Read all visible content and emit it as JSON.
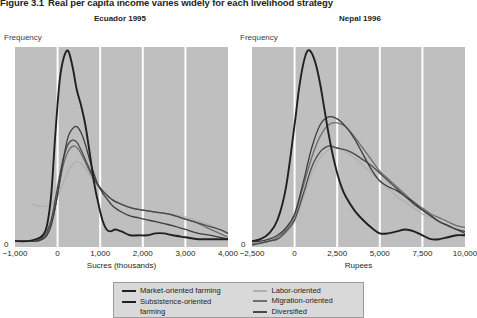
{
  "figure": {
    "number": "Figure 3.1",
    "title": "Real per capita income varies widely for each livelihood strategy"
  },
  "panels": [
    {
      "id": "ecuador",
      "title": "Ecuador 1995",
      "ylabel": "Frequency",
      "xlabel": "Sucres (thousands)",
      "y_zero_label": "0",
      "xticks": [
        "−1,000",
        "0",
        "1,000",
        "2,000",
        "3,000",
        "4,000"
      ]
    },
    {
      "id": "nepal",
      "title": "Nepal 1996",
      "ylabel": "Frequency",
      "xlabel": "Rupees",
      "y_zero_label": "0",
      "xticks": [
        "−2,500",
        "0",
        "2,500",
        "5,000",
        "7,500",
        "10,000"
      ]
    }
  ],
  "legend": {
    "items": [
      {
        "label": "Market-oriented farming",
        "color": "#231f20"
      },
      {
        "label": "Subsistence-oriented",
        "label_cont": "farming",
        "color": "#231f20"
      },
      {
        "label": "Labor-oriented",
        "color": "#b0b0b0"
      },
      {
        "label": "Migration-oriented",
        "color": "#6e6e6e"
      },
      {
        "label": "Diversified",
        "color": "#4a4a4a"
      }
    ]
  },
  "colors": {
    "plot_background": "#bfbfbf",
    "gridline": "#ffffff",
    "legend_background": "#d9d9d9",
    "legend_border": "#9b9b9b",
    "text": "#231f20"
  },
  "chart_data": {
    "type": "line",
    "title": "Real per capita income varies widely for each livelihood strategy",
    "panels": [
      {
        "title": "Ecuador 1995",
        "xlabel": "Sucres (thousands)",
        "ylabel": "Frequency",
        "xlim": [
          -1000,
          4000
        ],
        "ylim": [
          0,
          1
        ],
        "grid": "vertical",
        "xticks": [
          -1000,
          0,
          1000,
          2000,
          3000,
          4000
        ],
        "series": [
          {
            "name": "Market-oriented farming",
            "color": "#231f20",
            "x": [
              -1000,
              -700,
              -500,
              -350,
              -250,
              -150,
              -50,
              50,
              150,
              250,
              350,
              450,
              550,
              650,
              750,
              850,
              950,
              1050,
              1150,
              1250,
              1350,
              1500,
              1700,
              1900,
              2100,
              2300,
              2500,
              2700,
              3000,
              3300,
              3600,
              4000
            ],
            "values": [
              0.02,
              0.02,
              0.03,
              0.05,
              0.1,
              0.26,
              0.58,
              0.85,
              0.97,
              1.0,
              0.92,
              0.8,
              0.72,
              0.62,
              0.48,
              0.33,
              0.22,
              0.13,
              0.08,
              0.07,
              0.08,
              0.07,
              0.05,
              0.05,
              0.05,
              0.06,
              0.06,
              0.05,
              0.04,
              0.03,
              0.03,
              0.03
            ]
          },
          {
            "name": "Subsistence-oriented farming",
            "color": "#3d3d3d",
            "x": [
              -1000,
              -700,
              -500,
              -350,
              -250,
              -150,
              -50,
              50,
              150,
              250,
              350,
              450,
              550,
              650,
              750,
              850,
              950,
              1050,
              1150,
              1300,
              1500,
              1700,
              1900,
              2100,
              2300,
              2500,
              2700,
              3000,
              3300,
              3600,
              4000
            ],
            "values": [
              0.02,
              0.02,
              0.02,
              0.03,
              0.05,
              0.1,
              0.2,
              0.33,
              0.46,
              0.56,
              0.6,
              0.61,
              0.58,
              0.52,
              0.44,
              0.37,
              0.31,
              0.27,
              0.24,
              0.2,
              0.17,
              0.15,
              0.14,
              0.13,
              0.12,
              0.11,
              0.1,
              0.08,
              0.06,
              0.05,
              0.03
            ]
          },
          {
            "name": "Labor-oriented",
            "color": "#b0b0b0",
            "x": [
              -600,
              -450,
              -300,
              -150,
              0,
              150,
              300,
              450,
              600,
              750,
              900,
              1050,
              1250,
              1500,
              1750,
              2000,
              2300,
              2600,
              2900,
              3200,
              3500,
              3800,
              4000
            ],
            "values": [
              0.21,
              0.2,
              0.2,
              0.21,
              0.25,
              0.33,
              0.4,
              0.43,
              0.41,
              0.36,
              0.32,
              0.28,
              0.24,
              0.21,
              0.19,
              0.18,
              0.17,
              0.16,
              0.15,
              0.13,
              0.11,
              0.08,
              0.06
            ]
          },
          {
            "name": "Migration-oriented",
            "color": "#6e6e6e",
            "x": [
              -450,
              -300,
              -200,
              -100,
              0,
              100,
              200,
              300,
              400,
              500,
              600,
              750,
              900,
              1050,
              1250,
              1500,
              1750,
              2000,
              2300,
              2600,
              2900,
              3200,
              3500,
              3800,
              4000
            ],
            "values": [
              0.02,
              0.04,
              0.08,
              0.15,
              0.26,
              0.38,
              0.46,
              0.5,
              0.51,
              0.49,
              0.45,
              0.38,
              0.32,
              0.28,
              0.24,
              0.21,
              0.19,
              0.18,
              0.17,
              0.16,
              0.14,
              0.12,
              0.09,
              0.06,
              0.04
            ]
          },
          {
            "name": "Diversified",
            "color": "#4a4a4a",
            "x": [
              -500,
              -350,
              -250,
              -150,
              -50,
              50,
              150,
              250,
              350,
              450,
              550,
              650,
              800,
              950,
              1100,
              1300,
              1500,
              1750,
              2000,
              2300,
              2600,
              2900,
              3200,
              3500,
              3800,
              4000
            ],
            "values": [
              0.02,
              0.04,
              0.07,
              0.13,
              0.24,
              0.36,
              0.46,
              0.52,
              0.54,
              0.53,
              0.49,
              0.44,
              0.37,
              0.31,
              0.27,
              0.23,
              0.21,
              0.19,
              0.18,
              0.17,
              0.16,
              0.14,
              0.12,
              0.1,
              0.08,
              0.06
            ]
          }
        ]
      },
      {
        "title": "Nepal 1996",
        "xlabel": "Rupees",
        "ylabel": "Frequency",
        "xlim": [
          -2500,
          10000
        ],
        "ylim": [
          0,
          1
        ],
        "grid": "vertical",
        "xticks": [
          -2500,
          0,
          2500,
          5000,
          7500,
          10000
        ],
        "series": [
          {
            "name": "Market-oriented farming",
            "color": "#231f20",
            "x": [
              -2500,
              -2000,
              -1500,
              -1000,
              -500,
              0,
              250,
              500,
              750,
              1000,
              1250,
              1500,
              1750,
              2000,
              2250,
              2500,
              2750,
              3000,
              3500,
              4000,
              4500,
              5000,
              5500,
              6000,
              6500,
              7000,
              7500,
              8000,
              8500,
              9000,
              9500,
              10000
            ],
            "values": [
              0.02,
              0.03,
              0.06,
              0.13,
              0.3,
              0.62,
              0.8,
              0.93,
              1.0,
              0.99,
              0.93,
              0.83,
              0.7,
              0.57,
              0.46,
              0.37,
              0.3,
              0.25,
              0.18,
              0.13,
              0.09,
              0.06,
              0.06,
              0.07,
              0.08,
              0.07,
              0.05,
              0.03,
              0.03,
              0.04,
              0.05,
              0.05
            ]
          },
          {
            "name": "Subsistence-oriented farming",
            "color": "#3d3d3d",
            "x": [
              -2500,
              -2000,
              -1500,
              -1000,
              -500,
              0,
              500,
              1000,
              1500,
              2000,
              2500,
              3000,
              3500,
              4000,
              4500,
              5000,
              5500,
              6000,
              6500,
              7000,
              7500,
              8000,
              8500,
              9000,
              9500,
              10000
            ],
            "values": [
              0.02,
              0.02,
              0.03,
              0.05,
              0.09,
              0.16,
              0.32,
              0.5,
              0.62,
              0.66,
              0.65,
              0.61,
              0.55,
              0.47,
              0.39,
              0.33,
              0.3,
              0.28,
              0.25,
              0.22,
              0.18,
              0.15,
              0.12,
              0.1,
              0.08,
              0.07
            ]
          },
          {
            "name": "Labor-oriented",
            "color": "#b0b0b0",
            "x": [
              -2500,
              -2000,
              -1500,
              -1000,
              -500,
              0,
              500,
              1000,
              1500,
              2000,
              2500,
              3000,
              3500,
              4000,
              4500,
              5000,
              5500,
              6000,
              6500,
              7000,
              7500,
              8000,
              8500,
              9000,
              9500,
              10000
            ],
            "values": [
              0.0,
              0.01,
              0.02,
              0.03,
              0.06,
              0.12,
              0.24,
              0.37,
              0.45,
              0.49,
              0.5,
              0.48,
              0.45,
              0.41,
              0.37,
              0.33,
              0.29,
              0.25,
              0.22,
              0.19,
              0.16,
              0.14,
              0.12,
              0.1,
              0.08,
              0.07
            ]
          },
          {
            "name": "Migration-oriented",
            "color": "#6e6e6e",
            "x": [
              -2500,
              -2000,
              -1500,
              -1000,
              -500,
              0,
              500,
              1000,
              1500,
              2000,
              2500,
              3000,
              3500,
              4000,
              4500,
              5000,
              5500,
              6000,
              6500,
              7000,
              7500,
              8000,
              8500,
              9000,
              9500,
              10000
            ],
            "values": [
              0.01,
              0.01,
              0.02,
              0.04,
              0.08,
              0.15,
              0.3,
              0.45,
              0.56,
              0.62,
              0.63,
              0.61,
              0.56,
              0.5,
              0.44,
              0.38,
              0.34,
              0.3,
              0.26,
              0.22,
              0.19,
              0.16,
              0.14,
              0.12,
              0.1,
              0.09
            ]
          },
          {
            "name": "Diversified",
            "color": "#4a4a4a",
            "x": [
              -2500,
              -2000,
              -1500,
              -1000,
              -500,
              0,
              500,
              1000,
              1500,
              2000,
              2500,
              3000,
              3500,
              4000,
              4500,
              5000,
              5500,
              6000,
              6500,
              7000,
              7500,
              8000,
              8500,
              9000,
              9500,
              10000
            ],
            "values": [
              0.0,
              0.01,
              0.02,
              0.03,
              0.07,
              0.13,
              0.26,
              0.4,
              0.48,
              0.51,
              0.5,
              0.49,
              0.47,
              0.44,
              0.41,
              0.37,
              0.33,
              0.29,
              0.25,
              0.21,
              0.18,
              0.15,
              0.12,
              0.1,
              0.08,
              0.06
            ]
          }
        ]
      }
    ]
  }
}
